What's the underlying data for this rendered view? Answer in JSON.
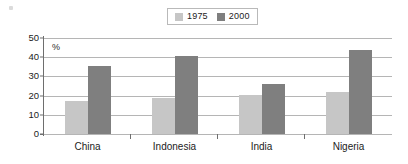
{
  "legend": {
    "entries": [
      {
        "label": "1975",
        "color": "#c6c6c6"
      },
      {
        "label": "2000",
        "color": "#7f7f7f"
      }
    ]
  },
  "axis": {
    "unit": "%",
    "yticks": [
      "0",
      "10",
      "20",
      "30",
      "40",
      "50"
    ]
  },
  "chart_data": {
    "type": "bar",
    "title": "",
    "subtitle": "",
    "xlabel": "",
    "ylabel": "%",
    "ylim": [
      0,
      50
    ],
    "ytick_step": 10,
    "grid": true,
    "legend_position": "top-center",
    "categories": [
      "China",
      "Indonesia",
      "India",
      "Nigeria"
    ],
    "series": [
      {
        "name": "1975",
        "color": "#c6c6c6",
        "values": [
          17,
          19,
          20.5,
          22
        ]
      },
      {
        "name": "2000",
        "color": "#7f7f7f",
        "values": [
          35.5,
          40.5,
          26,
          43.5
        ]
      }
    ]
  }
}
